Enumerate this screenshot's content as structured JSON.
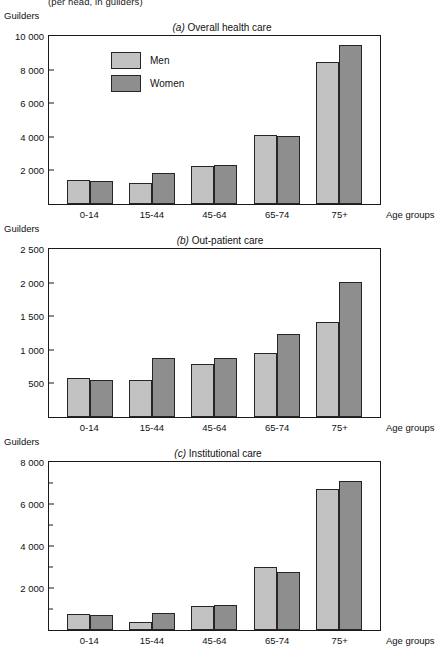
{
  "page": {
    "cut_off_header": "(per head, in guilders)",
    "axis_y_title": "Guilders",
    "axis_x_title": "Age groups",
    "legend": [
      {
        "key": "men",
        "label": "Men",
        "color": "#c2c2c2"
      },
      {
        "key": "women",
        "label": "Women",
        "color": "#8e8e8e"
      }
    ]
  },
  "chart_data": [
    {
      "id": "a",
      "type": "bar",
      "tag": "(a)",
      "title": "Overall health care",
      "title_full": "(a) Overall health care",
      "categories": [
        "0-14",
        "15-44",
        "45-64",
        "65-74",
        "75+"
      ],
      "series": [
        {
          "name": "Men",
          "color": "#c2c2c2",
          "values": [
            1450,
            1250,
            2250,
            4080,
            8480
          ]
        },
        {
          "name": "Women",
          "color": "#8e8e8e",
          "values": [
            1350,
            1850,
            2320,
            4070,
            9450
          ]
        }
      ],
      "xlabel": "Age groups",
      "ylabel": "Guilders",
      "ylim": [
        0,
        10000
      ],
      "yticks": [
        0,
        2000,
        4000,
        6000,
        8000,
        10000
      ],
      "ytick_labels": [
        "",
        "2 000",
        "4 000",
        "6 000",
        "8 000",
        "10 000"
      ],
      "minor_ticks": [],
      "grid": false,
      "legend_position": "inside-top-left"
    },
    {
      "id": "b",
      "type": "bar",
      "tag": "(b)",
      "title": "Out-patient care",
      "title_full": "(b) Out-patient care",
      "categories": [
        "0-14",
        "15-44",
        "45-64",
        "65-74",
        "75+"
      ],
      "series": [
        {
          "name": "Men",
          "color": "#c2c2c2",
          "values": [
            575,
            550,
            790,
            955,
            1410
          ]
        },
        {
          "name": "Women",
          "color": "#8e8e8e",
          "values": [
            550,
            880,
            875,
            1240,
            2010
          ]
        }
      ],
      "xlabel": "Age groups",
      "ylabel": "Guilders",
      "ylim": [
        0,
        2500
      ],
      "yticks": [
        0,
        500,
        1000,
        1500,
        2000,
        2500
      ],
      "ytick_labels": [
        "",
        "500",
        "1 000",
        "1 500",
        "2 000",
        "2 500"
      ],
      "minor_ticks": [],
      "grid": false,
      "legend_position": "none"
    },
    {
      "id": "c",
      "type": "bar",
      "tag": "(c)",
      "title": "Institutional care",
      "title_full": "(c) Institutional care",
      "categories": [
        "0-14",
        "15-44",
        "45-64",
        "65-74",
        "75+"
      ],
      "series": [
        {
          "name": "Men",
          "color": "#c2c2c2",
          "values": [
            760,
            400,
            1150,
            3000,
            6720
          ]
        },
        {
          "name": "Women",
          "color": "#8e8e8e",
          "values": [
            700,
            790,
            1200,
            2740,
            7100
          ]
        }
      ],
      "xlabel": "Age groups",
      "ylabel": "Guilders",
      "ylim": [
        0,
        8000
      ],
      "yticks": [
        0,
        2000,
        4000,
        6000,
        8000
      ],
      "ytick_labels": [
        "",
        "2 000",
        "4 000",
        "6 000",
        "8 000"
      ],
      "minor_ticks": [
        1000,
        3000,
        5000,
        7000
      ],
      "grid": false,
      "legend_position": "none"
    }
  ]
}
